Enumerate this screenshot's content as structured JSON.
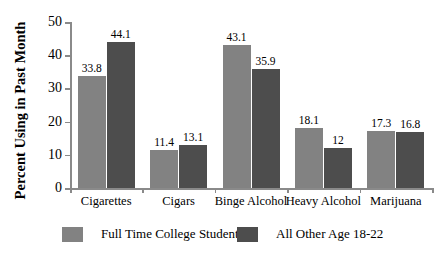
{
  "chart_data": {
    "type": "bar",
    "title": "",
    "xlabel": "",
    "ylabel": "Percent Using in Past Month",
    "ylim": [
      0,
      50
    ],
    "yticks": [
      0,
      10,
      20,
      30,
      40,
      50
    ],
    "ytick_labels": [
      "0",
      "10",
      "20",
      "30",
      "40",
      "50"
    ],
    "grid": false,
    "legend_position": "bottom",
    "categories": [
      "Cigarettes",
      "Cigars",
      "Binge Alcohol",
      "Heavy Alcohol",
      "Marijuana"
    ],
    "series": [
      {
        "name": "Full Time College Student",
        "color": "#828282",
        "values": [
          33.8,
          11.4,
          43.1,
          18.1,
          17.3
        ],
        "value_labels": [
          "33.8",
          "11.4",
          "43.1",
          "18.1",
          "17.3"
        ]
      },
      {
        "name": "All Other Age 18-22",
        "color": "#4d4d4d",
        "values": [
          44.1,
          13.1,
          35.9,
          12,
          16.8
        ],
        "value_labels": [
          "44.1",
          "13.1",
          "35.9",
          "12",
          "16.8"
        ]
      }
    ]
  },
  "axis": {
    "color": "#8a8a8a"
  }
}
